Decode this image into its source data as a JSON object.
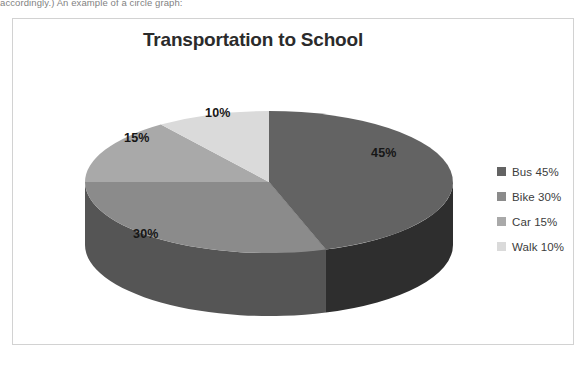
{
  "scan": {
    "top_cropped_text": "accordingly.) An example of a circle graph:"
  },
  "chart_frame": {
    "border_color": "#d2d2d2",
    "background": "#ffffff"
  },
  "chart_data": {
    "type": "pie",
    "title": "Transportation to School",
    "xlabel": "",
    "ylabel": "",
    "categories": [
      "Bus",
      "Bike",
      "Car",
      "Walk"
    ],
    "values": [
      45,
      30,
      15,
      10
    ],
    "value_unit": "%",
    "data_labels": [
      "45%",
      "30%",
      "15%",
      "10%"
    ],
    "legend_entries": [
      "Bus 45%",
      "Bike 30%",
      "Car 15%",
      "Walk 10%"
    ],
    "legend_position": "right",
    "colors": [
      "#636363",
      "#8b8b8b",
      "#a9a9a9",
      "#dadada"
    ],
    "side_colors": [
      "#2e2e2e",
      "#555555",
      "#6d6d6d",
      "#9d9d9d"
    ],
    "grid": false,
    "three_d": true,
    "start_angle_deg": 0,
    "direction": "clockwise",
    "geometry": {
      "center_x": 256,
      "center_y": 163,
      "radius_x": 184,
      "radius_y": 71,
      "depth": 63
    },
    "slices": [
      {
        "name": "Bus",
        "value": 45,
        "label": "45%",
        "legend": "Bus 45%",
        "color": "#636363",
        "side_color": "#2e2e2e",
        "start_deg": 0,
        "end_deg": 162
      },
      {
        "name": "Bike",
        "value": 30,
        "label": "30%",
        "legend": "Bike 30%",
        "color": "#8b8b8b",
        "side_color": "#555555",
        "start_deg": 162,
        "end_deg": 270
      },
      {
        "name": "Car",
        "value": 15,
        "label": "15%",
        "legend": "Car 15%",
        "color": "#a9a9a9",
        "side_color": "#6d6d6d",
        "start_deg": 270,
        "end_deg": 324
      },
      {
        "name": "Walk",
        "value": 10,
        "label": "10%",
        "legend": "Walk 10%",
        "color": "#dadada",
        "side_color": "#9d9d9d",
        "start_deg": 324,
        "end_deg": 360
      }
    ]
  }
}
